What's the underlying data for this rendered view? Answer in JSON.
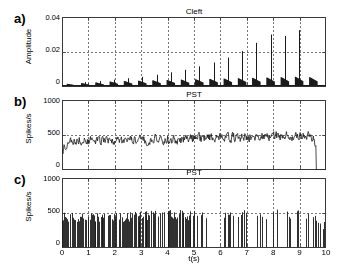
{
  "figure": {
    "xlabel": "t(s)",
    "background": "#ffffff",
    "axis_color": "#3a3a3a",
    "grid_color": "#555555",
    "trace_color": "#1a1a1a"
  },
  "panels": [
    {
      "label": "a)",
      "title": "Cleft",
      "ylabel": "Amplitude",
      "yticks": [
        "0",
        "0.02",
        "0.04"
      ],
      "ytick_values": [
        0,
        0.02,
        0.04
      ],
      "ylim": [
        0,
        0.04
      ],
      "xlim": [
        0,
        10
      ],
      "xticks_visible": false,
      "href_line": 0.02
    },
    {
      "label": "b)",
      "title": "PST",
      "ylabel": "Spikes/s",
      "yticks": [
        "0",
        "500",
        "1000"
      ],
      "ytick_values": [
        0,
        500,
        1000
      ],
      "ylim": [
        0,
        1000
      ],
      "xlim": [
        0,
        10
      ],
      "xticks_visible": false,
      "href_line": 500
    },
    {
      "label": "c)",
      "title": "PST",
      "ylabel": "Spikes/s",
      "yticks": [
        "0",
        "500",
        "1000"
      ],
      "ytick_values": [
        0,
        500,
        1000
      ],
      "ylim": [
        0,
        1000
      ],
      "xlim": [
        0,
        10
      ],
      "xticks_visible": true,
      "xticks": [
        "0",
        "1",
        "2",
        "3",
        "4",
        "5",
        "6",
        "7",
        "8",
        "9",
        "10"
      ],
      "href_line": 500
    }
  ],
  "chart_data": [
    {
      "type": "bar",
      "panel": "a",
      "title": "Cleft",
      "xlabel": "t(s)",
      "ylabel": "Amplitude",
      "xlim": [
        0,
        10
      ],
      "ylim": [
        0,
        0.04
      ],
      "grid": true,
      "reference_line": 0.02,
      "description": "Neurotransmitter cleft concentration: 18 periodic bursts with growing amplitude; later bursts show a tall transient onset spike followed by a decaying plateau.",
      "bursts": [
        {
          "t": 0.18,
          "peak": 0.0022,
          "plateau": 0.0018,
          "width": 0.3
        },
        {
          "t": 0.72,
          "peak": 0.0028,
          "plateau": 0.0022,
          "width": 0.3
        },
        {
          "t": 1.26,
          "peak": 0.0034,
          "plateau": 0.0026,
          "width": 0.3
        },
        {
          "t": 1.8,
          "peak": 0.0042,
          "plateau": 0.0031,
          "width": 0.3
        },
        {
          "t": 2.34,
          "peak": 0.005,
          "plateau": 0.0034,
          "width": 0.3
        },
        {
          "t": 2.88,
          "peak": 0.0058,
          "plateau": 0.0036,
          "width": 0.3
        },
        {
          "t": 3.42,
          "peak": 0.007,
          "plateau": 0.0038,
          "width": 0.3
        },
        {
          "t": 3.96,
          "peak": 0.0084,
          "plateau": 0.004,
          "width": 0.3
        },
        {
          "t": 4.5,
          "peak": 0.0098,
          "plateau": 0.0042,
          "width": 0.3
        },
        {
          "t": 5.04,
          "peak": 0.0118,
          "plateau": 0.0044,
          "width": 0.3
        },
        {
          "t": 5.58,
          "peak": 0.014,
          "plateau": 0.0046,
          "width": 0.3
        },
        {
          "t": 6.12,
          "peak": 0.0168,
          "plateau": 0.0048,
          "width": 0.3
        },
        {
          "t": 6.66,
          "peak": 0.0205,
          "plateau": 0.005,
          "width": 0.3
        },
        {
          "t": 7.2,
          "peak": 0.0252,
          "plateau": 0.0052,
          "width": 0.3
        },
        {
          "t": 7.74,
          "peak": 0.03,
          "plateau": 0.0054,
          "width": 0.3
        },
        {
          "t": 8.28,
          "peak": 0.0292,
          "plateau": 0.0056,
          "width": 0.3
        },
        {
          "t": 8.82,
          "peak": 0.0325,
          "plateau": 0.0058,
          "width": 0.3
        },
        {
          "t": 9.36,
          "peak": 0.006,
          "plateau": 0.0056,
          "width": 0.3
        }
      ]
    },
    {
      "type": "line",
      "panel": "b",
      "title": "PST",
      "xlabel": "t(s)",
      "ylabel": "Spikes/s",
      "xlim": [
        0,
        10
      ],
      "ylim": [
        0,
        1000
      ],
      "grid": true,
      "reference_line": 500,
      "description": "Post-stimulus time histogram: noisy firing rate fluctuating about 380-520 spikes/s, drifting slightly upward across the record, with a sharp drop to 0 at the end.",
      "mean_envelope": [
        {
          "t": 0.0,
          "rate": 300
        },
        {
          "t": 0.3,
          "rate": 430
        },
        {
          "t": 1.0,
          "rate": 420
        },
        {
          "t": 2.0,
          "rate": 415
        },
        {
          "t": 3.0,
          "rate": 425
        },
        {
          "t": 4.0,
          "rate": 440
        },
        {
          "t": 5.0,
          "rate": 455
        },
        {
          "t": 6.0,
          "rate": 460
        },
        {
          "t": 7.0,
          "rate": 470
        },
        {
          "t": 8.0,
          "rate": 480
        },
        {
          "t": 9.0,
          "rate": 490
        },
        {
          "t": 9.4,
          "rate": 500
        },
        {
          "t": 9.6,
          "rate": 380
        },
        {
          "t": 9.7,
          "rate": 0
        }
      ],
      "noise_amplitude": 95,
      "samples": 520
    },
    {
      "type": "bar",
      "panel": "c",
      "title": "PST",
      "xlabel": "t(s)",
      "ylabel": "Spikes/s",
      "xlim": [
        0,
        10
      ],
      "ylim": [
        0,
        1000
      ],
      "grid": true,
      "reference_line": 500,
      "description": "Post-stimulus time histogram rendered as dense vertical spike bins; most bins reach 350-520 spikes/s with frequent drops to near zero, becoming sparser after t=5 s.",
      "spike_envelope": [
        {
          "t": 0.0,
          "rate": 430
        },
        {
          "t": 1.0,
          "rate": 440
        },
        {
          "t": 2.0,
          "rate": 440
        },
        {
          "t": 3.0,
          "rate": 455
        },
        {
          "t": 4.0,
          "rate": 470
        },
        {
          "t": 5.0,
          "rate": 470
        },
        {
          "t": 6.0,
          "rate": 475
        },
        {
          "t": 7.0,
          "rate": 480
        },
        {
          "t": 8.0,
          "rate": 485
        },
        {
          "t": 9.0,
          "rate": 495
        },
        {
          "t": 9.5,
          "rate": 470
        },
        {
          "t": 10.0,
          "rate": 300
        }
      ],
      "bin_count": 300,
      "dropout_rate": 0.3
    }
  ]
}
